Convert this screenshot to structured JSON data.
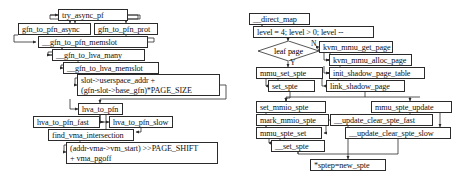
{
  "diagram": {
    "title": "",
    "left_flow": {
      "name": "gfn-to-pfn-translation-flow",
      "nodes": [
        {
          "id": "try_async_pf",
          "label": "try_async_pf",
          "x": 58,
          "y": 9,
          "w": 70,
          "h": 12
        },
        {
          "id": "gfn_to_pfn_async",
          "label": "gfn_to_pfn_async",
          "x": 18,
          "y": 23,
          "w": 73,
          "h": 12
        },
        {
          "id": "gfn_to_pfn_prot",
          "label": "gfn_to_pfn_prot",
          "x": 94,
          "y": 23,
          "w": 64,
          "h": 12
        },
        {
          "id": "gfn_to_pfn_memslot",
          "label": "__gfn_to_pfn_memslot",
          "x": 38,
          "y": 36,
          "w": 110,
          "h": 12
        },
        {
          "id": "gfn_to_hva_many",
          "label": "__gfn_to_hva_many",
          "x": 52,
          "y": 49,
          "w": 93,
          "h": 12
        },
        {
          "id": "gfn_to_hva_memslot",
          "label": "__gfn_to_hva_memslot",
          "x": 63,
          "y": 62,
          "w": 96,
          "h": 12
        },
        {
          "id": "hva_to_pfn",
          "label": "hva_to_pfn",
          "x": 78,
          "y": 103,
          "w": 45,
          "h": 12
        },
        {
          "id": "hva_to_pfn_fast",
          "label": "hva_to_pfn_fast",
          "x": 33,
          "y": 116,
          "w": 67,
          "h": 12
        },
        {
          "id": "hva_to_pfn_slow",
          "label": "hva_to_pfn_slow",
          "x": 109,
          "y": 116,
          "w": 64,
          "h": 12
        },
        {
          "id": "find_vma_intersection",
          "label": "find_vma_intersection",
          "x": 48,
          "y": 129,
          "w": 86,
          "h": 12
        }
      ],
      "multiline_nodes": [
        {
          "id": "hva_calc",
          "lines": [
            "slot->userspace_addr +",
            "(gfn-slot->base_gfn)*PAGE_SIZE"
          ],
          "x": 77,
          "y": 74,
          "w": 143,
          "h": 22
        },
        {
          "id": "pgoff_calc",
          "lines": [
            "(addr-vma->vm_start) >>PAGE_SHIFT",
            "+ vma_pgoff"
          ],
          "x": 66,
          "y": 142,
          "w": 152,
          "h": 22
        }
      ]
    },
    "right_flow": {
      "name": "direct-map-shadow-page-flow",
      "nodes": [
        {
          "id": "direct_map",
          "label": "__direct_map",
          "x": 249,
          "y": 13,
          "w": 61,
          "h": 12
        },
        {
          "id": "loop_header",
          "label": "level = 4; level > 0; level --",
          "x": 253,
          "y": 26,
          "w": 121,
          "h": 12
        },
        {
          "id": "kvm_mmu_get_page",
          "label": "kvm_mmu_get_page",
          "x": 319,
          "y": 41,
          "w": 74,
          "h": 12
        },
        {
          "id": "kvm_mmu_alloc_page",
          "label": "kvm_mmu_alloc_page",
          "x": 329,
          "y": 54,
          "w": 83,
          "h": 12
        },
        {
          "id": "init_shadow_page_table",
          "label": "init_shadow_page_table",
          "x": 329,
          "y": 67,
          "w": 96,
          "h": 12
        },
        {
          "id": "mmu_set_spte",
          "label": "mmu_set_spte",
          "x": 256,
          "y": 67,
          "w": 67,
          "h": 12
        },
        {
          "id": "set_spte",
          "label": "set_spte",
          "x": 268,
          "y": 80,
          "w": 47,
          "h": 12
        },
        {
          "id": "link_shadow_page",
          "label": "link_shadow_page",
          "x": 326,
          "y": 80,
          "w": 79,
          "h": 12
        },
        {
          "id": "set_mmio_spte",
          "label": "set_mmio_spte",
          "x": 256,
          "y": 101,
          "w": 70,
          "h": 12
        },
        {
          "id": "mmu_spte_update",
          "label": "mmu_spte_update",
          "x": 371,
          "y": 101,
          "w": 81,
          "h": 12
        },
        {
          "id": "mark_mmio_spte",
          "label": "mark_mmio_spte",
          "x": 256,
          "y": 114,
          "w": 73,
          "h": 12
        },
        {
          "id": "update_clear_spte_fast",
          "label": "__update_clear_spte_fast",
          "x": 330,
          "y": 114,
          "w": 103,
          "h": 12
        },
        {
          "id": "mmu_spte_set",
          "label": "mmu_spte_set",
          "x": 256,
          "y": 127,
          "w": 66,
          "h": 12
        },
        {
          "id": "update_clear_spte_slow",
          "label": "__update_clear_spte_slow",
          "x": 345,
          "y": 127,
          "w": 106,
          "h": 12
        },
        {
          "id": "__set_spte",
          "label": "__set_spte",
          "x": 271,
          "y": 140,
          "w": 54,
          "h": 12
        },
        {
          "id": "sptep_new_spte",
          "label": "*sptep=new_spte",
          "x": 310,
          "y": 159,
          "w": 76,
          "h": 12
        }
      ],
      "decision": {
        "id": "leaf_page",
        "label": "leaf page",
        "x": 258,
        "y": 41,
        "w": 61,
        "h": 20,
        "branch_no": "N",
        "branch_yes": "Y"
      }
    }
  },
  "colors": {
    "stroke": "#2b2b2b",
    "background": "#ffffff",
    "text": "#111111"
  }
}
